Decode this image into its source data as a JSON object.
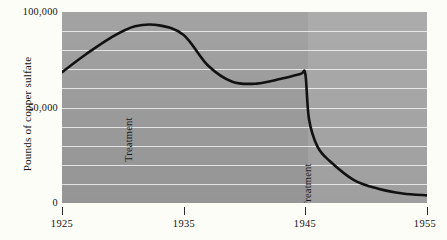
{
  "chart_data": {
    "type": "line",
    "title": "",
    "subtitle": "",
    "xlabel": "",
    "ylabel": "Pounds of copper sulfate",
    "xlim": [
      1925,
      1955
    ],
    "ylim": [
      0,
      100000
    ],
    "grid": true,
    "legend": "none",
    "gridline_interval": 10000,
    "x_ticks": [
      {
        "value": 1925,
        "label": "1925"
      },
      {
        "value": 1935,
        "label": "1935"
      },
      {
        "value": 1945,
        "label": "1945"
      },
      {
        "value": 1955,
        "label": "1955"
      }
    ],
    "y_ticks": [
      {
        "value": 0,
        "label": "0"
      },
      {
        "value": 50000,
        "label": "50,000"
      },
      {
        "value": 100000,
        "label": "100,000"
      }
    ],
    "series": [
      {
        "name": "Pounds of copper sulfate",
        "color": "#111111",
        "x": [
          1925,
          1927,
          1929,
          1931,
          1933,
          1935,
          1937,
          1939,
          1941,
          1943,
          1944.6,
          1945,
          1945.3,
          1946,
          1947,
          1949,
          1951,
          1953,
          1955
        ],
        "values": [
          68500,
          78000,
          86500,
          92500,
          93000,
          88000,
          72000,
          63500,
          62500,
          65000,
          67500,
          67500,
          44000,
          29500,
          22000,
          12000,
          7500,
          5000,
          4000
        ]
      }
    ],
    "annotations": [
      {
        "text": "Treatment",
        "x": 1925.5,
        "rotation": -90,
        "id": "treatment-1930"
      },
      {
        "text": "Treatment",
        "x": 1945,
        "rotation": -90,
        "id": "treatment-1945"
      }
    ],
    "gridlines_y": [
      10000,
      20000,
      30000,
      40000,
      50000,
      60000,
      70000,
      80000,
      90000
    ],
    "plot_background": "#a3a3a3",
    "page_background": "#fdfdf8"
  },
  "axes": {
    "y_title": "Pounds of copper sulfate",
    "y_label_0": "0",
    "y_label_50k": "50,000",
    "y_label_100k": "100,000",
    "x_label_1925": "1925",
    "x_label_1935": "1935",
    "x_label_1945": "1945",
    "x_label_1955": "1955"
  },
  "annotations": {
    "treatment_first": "Treatment",
    "treatment_second": "Treatment"
  }
}
